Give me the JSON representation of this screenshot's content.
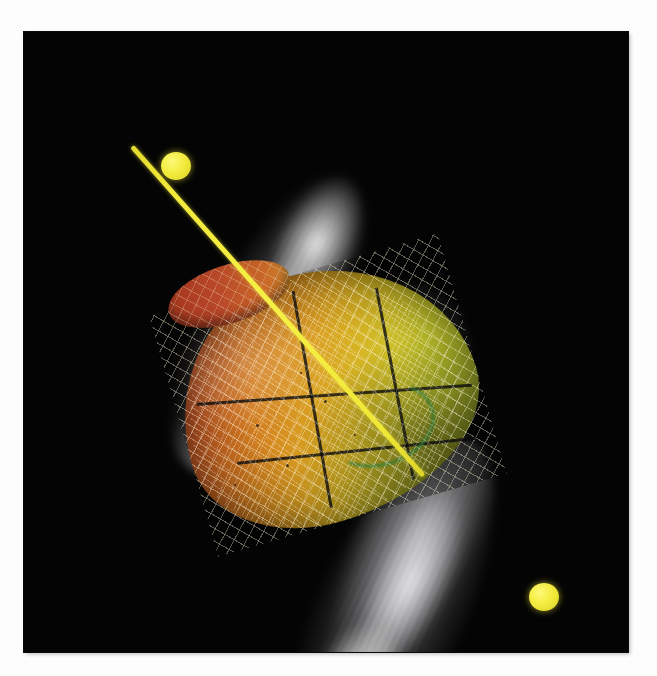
{
  "figure": {
    "domain": "scientific-visualization",
    "panel": {
      "background_color": "#040404",
      "width_px": 604,
      "height_px": 620,
      "left_px": 24,
      "top_px": 32
    },
    "caption": "",
    "scene_description": "Three-dimensional volume rendering of a bipolar outflow: a colored bell-shaped isosurface wrapped in a wireframe net, straddled by two white filamentary lobes and pierced by a yellow rotation axis terminated by spherical knots.",
    "elements": {
      "axis": {
        "name": "rotation-axis",
        "color": "#f3ec3e",
        "node_color": "#fdf978",
        "orientation_deg": 48.5,
        "node_count": 2,
        "node_labels": [
          "upper-left-knot",
          "lower-right-knot"
        ]
      },
      "isosurface": {
        "name": "colored-isosurface",
        "shape": "bell",
        "colormap": [
          "#b03d25",
          "#cf7320",
          "#d9a221",
          "#cfc129",
          "#bfc92e",
          "#8fb03c"
        ],
        "colormap_name": "red-orange-yellow-green",
        "cap_color": "#c0492a",
        "rim_color": "#2e7a38",
        "mesh_color": "#fff6d6",
        "panel_seam_color": "#08080a",
        "seam_count": 4
      },
      "outflow": {
        "name": "bipolar-outflow-lobes",
        "lobe_count": 2,
        "lobe_labels": [
          "upper-lobe",
          "lower-lobe"
        ],
        "color": "#ffffff",
        "rendering": "volumetric-filaments"
      },
      "veil": {
        "name": "wireframe-veil",
        "color": "#d6d8dc"
      }
    },
    "speckles": [
      {
        "left": 232,
        "top": 392,
        "size": 3
      },
      {
        "left": 262,
        "top": 432,
        "size": 3
      },
      {
        "left": 300,
        "top": 368,
        "size": 3
      },
      {
        "left": 210,
        "top": 452,
        "size": 2
      },
      {
        "left": 330,
        "top": 402,
        "size": 2
      },
      {
        "left": 276,
        "top": 340,
        "size": 2
      }
    ]
  }
}
